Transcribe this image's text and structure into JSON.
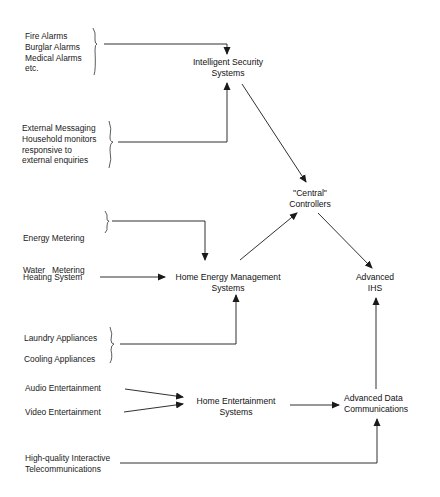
{
  "diagram": {
    "inputs": {
      "security_alarms": [
        "Fire Alarms",
        "Burglar Alarms",
        "Medical Alarms",
        "etc."
      ],
      "external_messaging": [
        "External Messaging",
        "Household monitors",
        "responsive to",
        "external enquiries"
      ],
      "metering": [
        "Energy Metering",
        "Water   Metering"
      ],
      "heating": "Heating System",
      "appliances": [
        "Laundry Appliances",
        "Cooling Appliances"
      ],
      "audio": "Audio Entertainment",
      "video": "Video Entertainment",
      "telecom": [
        "High-quality Interactive",
        "Telecommunications"
      ]
    },
    "nodes": {
      "intelligent_security": [
        "Intelligent Security",
        "Systems"
      ],
      "central_controllers": [
        "\"Central\"",
        "Controllers"
      ],
      "home_energy": [
        "Home Energy Management",
        "Systems"
      ],
      "advanced_ihs": [
        "Advanced",
        "IHS"
      ],
      "home_entertainment": [
        "Home Entertainment",
        "Systems"
      ],
      "advanced_data": [
        "Advanced Data",
        "Communications"
      ]
    },
    "edges": [
      {
        "from": "security_alarms",
        "to": "intelligent_security"
      },
      {
        "from": "external_messaging",
        "to": "intelligent_security"
      },
      {
        "from": "intelligent_security",
        "to": "central_controllers"
      },
      {
        "from": "metering",
        "to": "home_energy"
      },
      {
        "from": "heating",
        "to": "home_energy"
      },
      {
        "from": "appliances",
        "to": "home_energy"
      },
      {
        "from": "home_energy",
        "to": "central_controllers"
      },
      {
        "from": "central_controllers",
        "to": "advanced_ihs"
      },
      {
        "from": "audio",
        "to": "home_entertainment"
      },
      {
        "from": "video",
        "to": "home_entertainment"
      },
      {
        "from": "home_entertainment",
        "to": "advanced_data"
      },
      {
        "from": "telecom",
        "to": "advanced_data"
      },
      {
        "from": "advanced_data",
        "to": "advanced_ihs"
      }
    ],
    "line_color": "#1a1a1a"
  }
}
